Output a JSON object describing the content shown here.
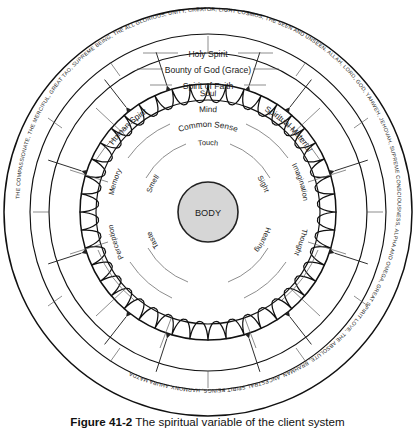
{
  "figure": {
    "caption_label": "Figure 41-2",
    "caption_text": "The spiritual variable of the client system"
  },
  "colors": {
    "body_fill": "#d6d6d6",
    "stroke": "#111111",
    "hairline": "#5b5b5b",
    "background": "#ffffff"
  },
  "rings": {
    "outer_ring": {
      "name": "names-of-the-divine-ring",
      "text": "THE COMPASSIONATE, THE MERCIFUL, GREAT TAO, SUPREME BEING, THE ALL GLORIOUS, UNITY, CREATOR, LIGHT COSMOS, THE SEEN AND UNSEEN, ALLAH, LORD, GOD, YAHWEH, JEHOVAH, SUPREME CONSCIOUSNESS, ALPHA AND OMEGA, GREAT SPIRIT LOVE, THE ABSOLUTE, BRAHMAN, ANCESTRAL SPIRIT BEINGS, HARMONY, AHURA MAZDA, "
    },
    "spirit_ring": {
      "name": "spirit-ring",
      "labels": [
        "Holy Spirit",
        "Bounty of God (Grace)",
        "Spirit of Faith"
      ]
    },
    "soul_ring": {
      "name": "soul-ring",
      "labels": [
        "Human Spirit",
        "Soul",
        "Spiritual Material"
      ]
    },
    "mind_ring": {
      "name": "mind-ring",
      "labels": [
        "Mind",
        "Common Sense"
      ]
    },
    "faculties_ring": {
      "name": "inner-faculties-ring",
      "labels": [
        "Memory",
        "Imagination",
        "Thought",
        "Perception"
      ]
    },
    "senses_ring": {
      "name": "five-senses-ring",
      "labels": [
        "Touch",
        "Sight",
        "Hearing",
        "Taste",
        "Smell"
      ]
    },
    "core": {
      "name": "body-core",
      "label": "BODY"
    }
  }
}
